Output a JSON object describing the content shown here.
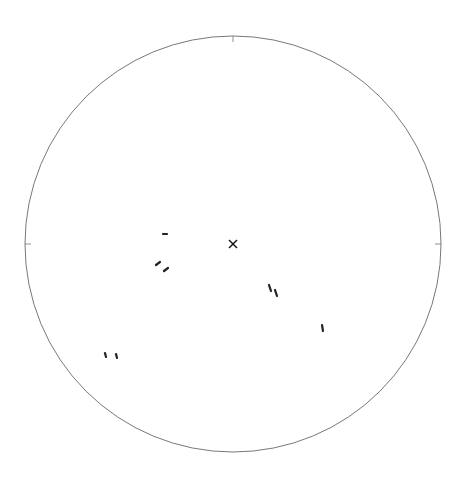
{
  "diagram": {
    "type": "stereographic projection",
    "primitive_circle": {
      "cx": 233,
      "cy": 244,
      "r": 208
    },
    "center": {
      "x": 233,
      "y": 244
    },
    "colors": {
      "primitive": "#555555",
      "small_circles": "#8a8a8a",
      "dashed": "#8f8f8f",
      "marks": "#222222"
    },
    "small_circles": [
      {
        "label": "20°",
        "cx": 192,
        "cy": 338,
        "r": 114
      },
      {
        "label": "25°",
        "cx": 204,
        "cy": 340,
        "r": 108
      },
      {
        "label": "30°",
        "cx": 212,
        "cy": 342,
        "r": 104
      },
      {
        "label": "35°",
        "cx": 221,
        "cy": 343,
        "r": 100
      },
      {
        "label": "40°",
        "cx": 228,
        "cy": 344,
        "r": 98
      },
      {
        "label": "45°",
        "cx": 234,
        "cy": 345,
        "r": 98
      }
    ],
    "dashed_lines_top": [
      {
        "x1": 233,
        "y1": 244,
        "x2": 233,
        "y2": 36
      },
      {
        "x1": 233,
        "y1": 244,
        "x2": 255,
        "y2": 37
      },
      {
        "x1": 233,
        "y1": 244,
        "x2": 277,
        "y2": 40
      },
      {
        "x1": 233,
        "y1": 244,
        "x2": 298,
        "y2": 46
      },
      {
        "x1": 233,
        "y1": 244,
        "x2": 318,
        "y2": 54
      },
      {
        "x1": 233,
        "y1": 244,
        "x2": 338,
        "y2": 64
      }
    ],
    "dashed_lines_bottom": [
      {
        "label": "20°",
        "x1": 233,
        "y1": 244,
        "x2": 124,
        "y2": 433
      },
      {
        "label": "25°",
        "x1": 233,
        "y1": 244,
        "x2": 146,
        "y2": 442
      },
      {
        "label": "30°",
        "x1": 233,
        "y1": 244,
        "x2": 167,
        "y2": 447
      },
      {
        "label": "35°",
        "x1": 233,
        "y1": 244,
        "x2": 188,
        "y2": 450
      },
      {
        "label": "40°",
        "x1": 233,
        "y1": 244,
        "x2": 210,
        "y2": 451
      },
      {
        "label": "45°",
        "x1": 233,
        "y1": 244,
        "x2": 232,
        "y2": 452
      }
    ],
    "circle_labels": [
      "20°",
      "25°",
      "30°",
      "35°",
      "40°",
      "45°"
    ],
    "bottom_labels": [
      "20°",
      "25°",
      "30°",
      "35°",
      "40°",
      "45°"
    ]
  }
}
